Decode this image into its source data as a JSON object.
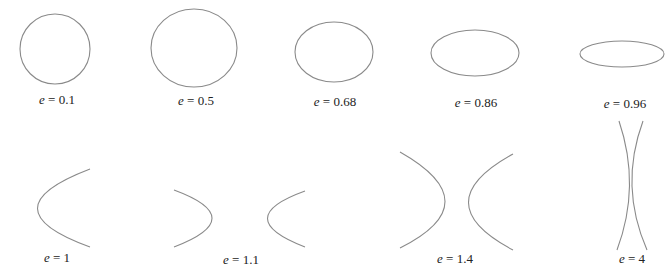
{
  "diagram": {
    "stroke_color": "#8a8a8a",
    "background": "#ffffff",
    "variable": "e",
    "equals": " = ",
    "panels": [
      {
        "id": "e01",
        "type": "ellipse",
        "e": "0.1",
        "cx": 55,
        "cy": 49,
        "rx": 35,
        "ry": 35,
        "label_x": 57,
        "label_y": 92
      },
      {
        "id": "e05",
        "type": "ellipse",
        "e": "0.5",
        "cx": 194,
        "cy": 48,
        "rx": 43,
        "ry": 39,
        "label_x": 196,
        "label_y": 93
      },
      {
        "id": "e068",
        "type": "ellipse",
        "e": "0.68",
        "cx": 334,
        "cy": 52,
        "rx": 39,
        "ry": 30,
        "label_x": 335,
        "label_y": 94
      },
      {
        "id": "e086",
        "type": "ellipse",
        "e": "0.86",
        "cx": 475,
        "cy": 53,
        "rx": 44,
        "ry": 23,
        "label_x": 476,
        "label_y": 95
      },
      {
        "id": "e096",
        "type": "ellipse",
        "e": "0.96",
        "cx": 622,
        "cy": 54,
        "rx": 42,
        "ry": 13,
        "label_x": 625,
        "label_y": 96
      },
      {
        "id": "e1",
        "type": "parabola",
        "e": "1",
        "path": "M90,169 Q-15,209 90,247",
        "label_x": 57,
        "label_y": 250
      },
      {
        "id": "e11",
        "type": "hyperbola",
        "e": "1.1",
        "paths": [
          "M174,190 Q250,218 174,247",
          "M305,191 Q230,218 305,247"
        ],
        "label_x": 241,
        "label_y": 252
      },
      {
        "id": "e14",
        "type": "hyperbola",
        "e": "1.4",
        "paths": [
          "M400,152 Q490,203 400,248",
          "M513,154 Q424,203 513,250"
        ],
        "label_x": 455,
        "label_y": 251
      },
      {
        "id": "e4",
        "type": "hyperbola",
        "e": "4",
        "paths": [
          "M619,121 Q641,186 617,250",
          "M643,121 Q619,186 647,250"
        ],
        "label_x": 632,
        "label_y": 251
      }
    ]
  }
}
